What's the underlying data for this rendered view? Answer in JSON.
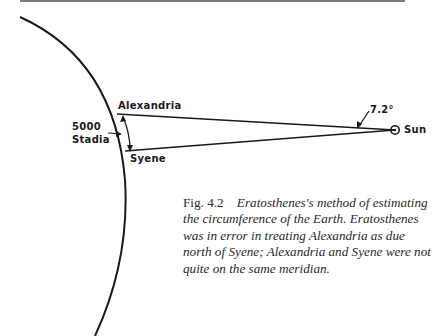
{
  "diagram": {
    "labels": {
      "alexandria": "Alexandria",
      "syene": "Syene",
      "distance_value": "5000",
      "distance_unit": "Stadia",
      "angle": "7.2°",
      "sun": "Sun"
    },
    "colors": {
      "line": "#1a1a1a",
      "rule": "#7a7a7a",
      "text": "#2a2a2a"
    }
  },
  "caption": {
    "figure_number": "Fig. 4.2",
    "text": "Eratosthenes's method of estimating the circumference of the Earth. Eratosthenes was in error in treating Alexandria as due north of Syene; Alexandria and Syene were not quite on the same meridian."
  }
}
